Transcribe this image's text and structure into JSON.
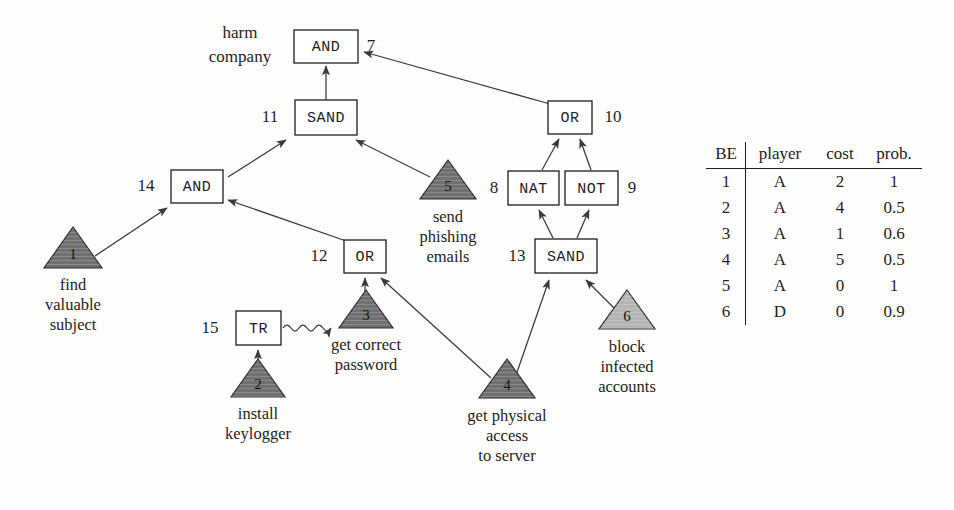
{
  "figure": {
    "type": "attack-defense-tree",
    "root_label": "harm\ncompany"
  },
  "colors": {
    "attacker_fill": "#707070",
    "defender_fill": "#b4b4b4",
    "gate_fill": "#ffffff",
    "stroke": "#1d1d1d",
    "background": "#fdfdfb"
  },
  "root": {
    "line1": "harm",
    "line2": "company"
  },
  "gates": [
    {
      "id": "7",
      "type": "AND",
      "x": 326,
      "y": 46,
      "id_x": 371,
      "id_y": 46,
      "w": 64,
      "h": 33
    },
    {
      "id": "11",
      "type": "SAND",
      "x": 320,
      "y": 117,
      "id_x": 270,
      "id_y": 117,
      "w": 62,
      "h": 35
    },
    {
      "id": "14",
      "type": "AND",
      "x": 197,
      "y": 186,
      "id_x": 148,
      "id_y": 186,
      "w": 52,
      "h": 33
    },
    {
      "id": "12",
      "type": "OR",
      "x": 365,
      "y": 256,
      "id_x": 320,
      "id_y": 256,
      "w": 42,
      "h": 33
    },
    {
      "id": "15",
      "type": "TR",
      "x": 258,
      "y": 328,
      "id_x": 211,
      "id_y": 328,
      "w": 45,
      "h": 34
    },
    {
      "id": "10",
      "type": "OR",
      "x": 570,
      "y": 117,
      "id_x": 612,
      "id_y": 117,
      "w": 44,
      "h": 33
    },
    {
      "id": "8",
      "type": "NAT",
      "x": 533,
      "y": 188,
      "id_x": 495,
      "id_y": 188,
      "w": 51,
      "h": 34
    },
    {
      "id": "9",
      "type": "NOT",
      "x": 591,
      "y": 188,
      "id_x": 629,
      "id_y": 188,
      "w": 53,
      "h": 34
    },
    {
      "id": "13",
      "type": "SAND",
      "x": 566,
      "y": 256,
      "id_x": 518,
      "id_y": 256,
      "w": 62,
      "h": 34
    }
  ],
  "basic_events": [
    {
      "id": "1",
      "player": "attacker",
      "cx": 73,
      "cy": 268,
      "half": 29,
      "height": 41,
      "label": [
        "find",
        "valuable",
        "subject"
      ],
      "label_x": 73,
      "label_y": 292
    },
    {
      "id": "2",
      "player": "attacker",
      "cx": 258,
      "cy": 397,
      "half": 27,
      "height": 39,
      "label": [
        "install",
        "keylogger"
      ],
      "label_x": 258,
      "label_y": 420
    },
    {
      "id": "3",
      "player": "attacker",
      "cx": 366,
      "cy": 328,
      "half": 27,
      "height": 39,
      "label": [
        "get correct",
        "password"
      ],
      "label_x": 366,
      "label_y": 351
    },
    {
      "id": "4",
      "player": "attacker",
      "cx": 507,
      "cy": 398,
      "half": 28,
      "height": 40,
      "label": [
        "get physical",
        "access",
        "to server"
      ],
      "label_x": 507,
      "label_y": 422
    },
    {
      "id": "5",
      "player": "attacker",
      "cx": 448,
      "cy": 187,
      "half": 28,
      "height": 40,
      "label": [
        "send",
        "phishing",
        "emails"
      ],
      "label_x": 448,
      "label_y": 211
    },
    {
      "id": "6",
      "player": "defender",
      "cx": 627,
      "cy": 328,
      "half": 28,
      "height": 40,
      "label": [
        "block",
        "infected",
        "accounts"
      ],
      "label_x": 627,
      "label_y": 352
    }
  ],
  "edges": [
    {
      "from": "11",
      "to": "7",
      "kind": "arrow"
    },
    {
      "from": "10",
      "to": "7",
      "kind": "arrow"
    },
    {
      "from": "14",
      "to": "11",
      "kind": "arrow"
    },
    {
      "from": "5",
      "to": "11",
      "kind": "arrow"
    },
    {
      "from": "1",
      "to": "14",
      "kind": "arrow"
    },
    {
      "from": "12",
      "to": "14",
      "kind": "arrow"
    },
    {
      "from": "3",
      "to": "12",
      "kind": "arrow"
    },
    {
      "from": "4",
      "to": "12",
      "kind": "arrow"
    },
    {
      "from": "2",
      "to": "15",
      "kind": "arrow"
    },
    {
      "from": "15",
      "to": "3",
      "kind": "squiggly-arrow"
    },
    {
      "from": "8",
      "to": "10",
      "kind": "arrow"
    },
    {
      "from": "9",
      "to": "10",
      "kind": "arrow"
    },
    {
      "from": "13",
      "to": "8",
      "kind": "arrow"
    },
    {
      "from": "13",
      "to": "9",
      "kind": "arrow"
    },
    {
      "from": "4",
      "to": "13",
      "kind": "arrow"
    },
    {
      "from": "6",
      "to": "13",
      "kind": "arrow"
    }
  ],
  "table": {
    "columns": [
      "BE",
      "player",
      "cost",
      "prob."
    ],
    "rows": [
      {
        "be": "1",
        "player": "A",
        "cost": "2",
        "prob": "1"
      },
      {
        "be": "2",
        "player": "A",
        "cost": "4",
        "prob": "0.5"
      },
      {
        "be": "3",
        "player": "A",
        "cost": "1",
        "prob": "0.6"
      },
      {
        "be": "4",
        "player": "A",
        "cost": "5",
        "prob": "0.5"
      },
      {
        "be": "5",
        "player": "A",
        "cost": "0",
        "prob": "1"
      },
      {
        "be": "6",
        "player": "D",
        "cost": "0",
        "prob": "0.9"
      }
    ]
  }
}
